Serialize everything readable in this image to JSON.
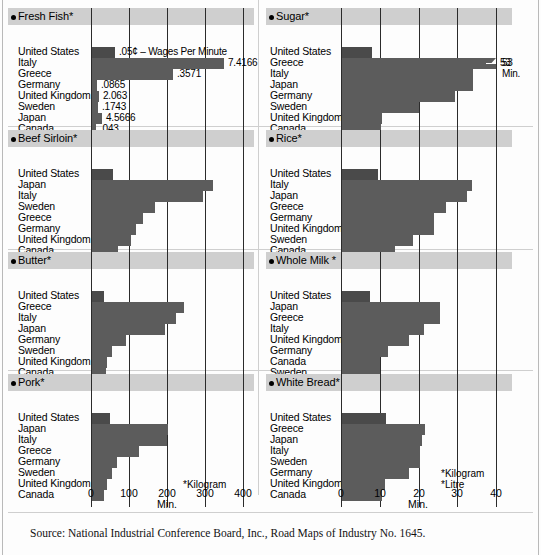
{
  "figure": {
    "source": "Source: National Industrial Conference Board, Inc., Road Maps of Industry No. 1645."
  },
  "chart_data": {
    "type": "bar",
    "orientation": "horizontal",
    "xlabel": "Min.",
    "grid": true,
    "legend": null,
    "panels": [
      {
        "id": "fresh-fish",
        "title": "Fresh Fish*",
        "column": "left",
        "xlim": [
          0,
          400
        ],
        "xticks": [
          0,
          100,
          200,
          300,
          400
        ],
        "categories": [
          "United States",
          "Italy",
          "Greece",
          "Germany",
          "United Kingdom",
          "Sweden",
          "Japan",
          "Canada"
        ],
        "values": [
          63,
          349,
          215,
          17,
          22,
          18,
          28,
          14
        ],
        "point_labels": [
          "",
          "7.4166",
          ".3571",
          ".0865",
          "2.063",
          ".1743",
          "4.5666",
          ".043"
        ],
        "annotation": ".05¢ – Wages Per Minute"
      },
      {
        "id": "sugar",
        "title": "Sugar*",
        "column": "right",
        "xlim": [
          0,
          40
        ],
        "xticks": [
          0,
          10,
          20,
          30,
          40
        ],
        "categories": [
          "United States",
          "Greece",
          "Italy",
          "Japan",
          "Germany",
          "Sweden",
          "United Kingdom",
          "Canada"
        ],
        "values": [
          8,
          40,
          34,
          34,
          29.5,
          20,
          10.5,
          10.3
        ],
        "point_labels": [
          "",
          "53",
          "",
          "",
          "",
          "",
          "",
          ""
        ],
        "annotation": "53\nMin.",
        "break_at_value": 40
      },
      {
        "id": "beef-sirloin",
        "title": "Beef Sirloin*",
        "column": "left",
        "xlim": [
          0,
          400
        ],
        "xticks": [
          0,
          100,
          200,
          300,
          400
        ],
        "categories": [
          "United States",
          "Japan",
          "Italy",
          "Sweden",
          "Greece",
          "Germany",
          "United Kingdom",
          "Canada"
        ],
        "values": [
          58,
          322,
          295,
          169,
          137,
          118,
          105,
          70
        ],
        "point_labels": [
          "",
          "",
          "",
          "",
          "",
          "",
          "",
          ""
        ],
        "annotation": ""
      },
      {
        "id": "rice",
        "title": "Rice*",
        "column": "right",
        "xlim": [
          0,
          40
        ],
        "xticks": [
          0,
          10,
          20,
          30,
          40
        ],
        "categories": [
          "United States",
          "Italy",
          "Japan",
          "Greece",
          "Germany",
          "United Kingdom",
          "Sweden",
          "Canada"
        ],
        "values": [
          9.5,
          33.8,
          32.5,
          27,
          24,
          24,
          18.5,
          14
        ],
        "point_labels": [
          "",
          "",
          "",
          "",
          "",
          "",
          "",
          ""
        ],
        "annotation": ""
      },
      {
        "id": "butter",
        "title": "Butter*",
        "column": "left",
        "xlim": [
          0,
          400
        ],
        "xticks": [
          0,
          100,
          200,
          300,
          400
        ],
        "categories": [
          "United States",
          "Greece",
          "Italy",
          "Japan",
          "Germany",
          "Sweden",
          "United Kingdom",
          "Canada"
        ],
        "values": [
          35,
          245,
          224,
          195,
          92,
          55,
          42,
          40
        ],
        "point_labels": [
          "",
          "",
          "",
          "",
          "",
          "",
          "",
          ""
        ],
        "annotation": ""
      },
      {
        "id": "whole-milk",
        "title": "Whole Milk *",
        "column": "right",
        "xlim": [
          0,
          40
        ],
        "xticks": [
          0,
          10,
          20,
          30,
          40
        ],
        "categories": [
          "United States",
          "Japan",
          "Greece",
          "Italy",
          "United Kingdom",
          "Germany",
          "Canada",
          "Sweden"
        ],
        "values": [
          7.5,
          25.5,
          25.5,
          21.5,
          17.5,
          12,
          10,
          10
        ],
        "point_labels": [
          "",
          "",
          "",
          "",
          "",
          "",
          "",
          ""
        ],
        "annotation": ""
      },
      {
        "id": "pork",
        "title": "Pork*",
        "column": "left",
        "xlim": [
          0,
          400
        ],
        "xticks": [
          0,
          100,
          200,
          300,
          400
        ],
        "categories": [
          "United States",
          "Japan",
          "Italy",
          "Greece",
          "Germany",
          "Sweden",
          "United Kingdom",
          "Canada"
        ],
        "values": [
          50,
          203,
          200,
          126,
          68,
          56,
          42,
          33
        ],
        "point_labels": [
          "",
          "",
          "",
          "",
          "",
          "",
          "",
          ""
        ],
        "annotation": "*Kilogram"
      },
      {
        "id": "white-bread",
        "title": "White Bread*",
        "column": "right",
        "xlim": [
          0,
          40
        ],
        "xticks": [
          0,
          10,
          20,
          30,
          40
        ],
        "categories": [
          "United States",
          "Greece",
          "Japan",
          "Italy",
          "Sweden",
          "Germany",
          "United Kingdom",
          "Canada"
        ],
        "values": [
          11.5,
          21.8,
          20.8,
          20.5,
          20.3,
          17.5,
          11.3,
          10.5
        ],
        "point_labels": [
          "",
          "",
          "",
          "",
          "",
          "",
          "",
          ""
        ],
        "annotation": "*Kilogram\n*Litre"
      }
    ],
    "axes": [
      {
        "id": "axis-left",
        "column": "left",
        "ticks": [
          "0",
          "100",
          "200",
          "300",
          "400"
        ],
        "unit": "Min."
      },
      {
        "id": "axis-right",
        "column": "right",
        "ticks": [
          "0",
          "10",
          "20",
          "30",
          "40"
        ],
        "unit": "Min."
      }
    ],
    "footnotes": {
      "pork_kilogram": "*Kilogram",
      "bread_kilogram": "*Kilogram",
      "bread_litre": "*Litre",
      "fish_wages": ".05¢ – Wages Per Minute",
      "sugar_break_value": "53",
      "sugar_break_unit": "Min."
    }
  }
}
